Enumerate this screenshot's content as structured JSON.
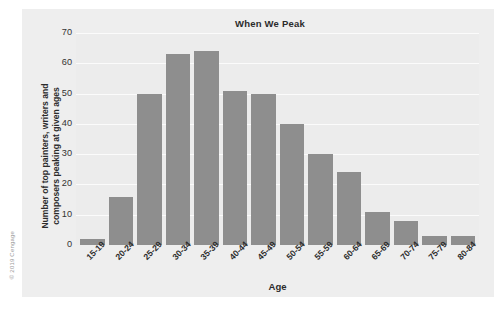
{
  "credit": "© 2019 Cengage",
  "chart_data": {
    "type": "bar",
    "title": "When We Peak",
    "xlabel": "Age",
    "ylabel": "Number of top painters, writers and composers peaking at given ages",
    "ylabel_lines": [
      "Number of top painters, writers and",
      "composers peaking at given ages"
    ],
    "categories": [
      "15-19",
      "20-24",
      "25-29",
      "30-34",
      "35-39",
      "40-44",
      "45-49",
      "50-54",
      "55-59",
      "60-64",
      "65-69",
      "70-74",
      "75-79",
      "80-84"
    ],
    "values": [
      2,
      16,
      50,
      63,
      64,
      51,
      50,
      40,
      30,
      24,
      11,
      8,
      3,
      3
    ],
    "ylim": [
      0,
      70
    ],
    "yticks": [
      0,
      10,
      20,
      30,
      40,
      50,
      60,
      70
    ],
    "ytick_labels": [
      "0",
      "10",
      "20",
      "30",
      "40",
      "50",
      "60",
      "70"
    ],
    "grid": true,
    "legend": "none",
    "bar_color": "#8e8e8e",
    "plot_background": "#ececec",
    "gridline_color": "#fbfbfb"
  }
}
